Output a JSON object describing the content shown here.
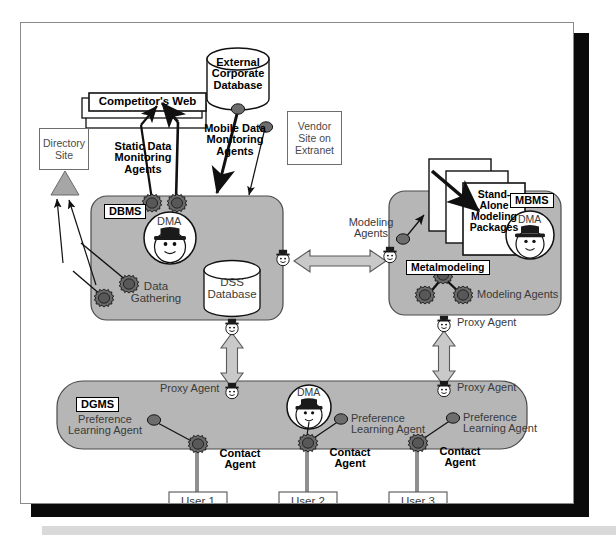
{
  "figure": {
    "kind": "architecture-diagram",
    "colors": {
      "subsystem_fill": "#b6b6b6",
      "subsystem_stroke": "#4a4a4a",
      "agent_fill": "#6f6f6f",
      "agent_stroke": "#1a1a1a",
      "arrow_fill": "#c9c9c9",
      "arrow_stroke": "#5a5a5a",
      "frame_shadow": "#0a0a0a",
      "bottom_bar": "#d9d9d9",
      "page_bg": "#ffffff"
    }
  },
  "external": {
    "corporate_database": "External\nCorporate\nDatabase",
    "competitors_web": "Competitor's Web",
    "directory_site": "Directory\nSite",
    "vendor_site": "Vendor\nSite on\nExtranet",
    "standalone_packages": "Stand-\nAlone\nModeling\nPackages"
  },
  "agent_labels": {
    "static_data_monitoring": "Static Data\nMonitoring\nAgents",
    "mobile_data_monitoring": "Mobile Data\nMonitoring\nAgents",
    "data_gathering": "Data\nGathering",
    "modeling_agents_left": "Modeling\nAgents",
    "modeling_agents_right": "Modeling Agents",
    "metamodeling": "Metalmodeling",
    "proxy_agent": "Proxy Agent",
    "preference_learning": "Preference\nLearning Agent",
    "contact_agent": "Contact\nAgent",
    "dma": "DMA"
  },
  "subsystems": [
    {
      "id": "dbms",
      "label": "DBMS"
    },
    {
      "id": "mbms",
      "label": "MBMS"
    },
    {
      "id": "dgms",
      "label": "DGMS"
    }
  ],
  "stores": {
    "dss_database": "DSS\nDatabase"
  },
  "users": [
    {
      "label": "User 1"
    },
    {
      "label": "User 2"
    },
    {
      "label": "User 3"
    }
  ],
  "proxy_agents": [
    {
      "id": "dbms-right",
      "label": ""
    },
    {
      "id": "mbms-left",
      "label": ""
    },
    {
      "id": "dbms-bottom",
      "label": ""
    },
    {
      "id": "mbms-bottom",
      "label": "Proxy Agent"
    },
    {
      "id": "dgms-left",
      "label": "Proxy Agent"
    },
    {
      "id": "dgms-right",
      "label": "Proxy Agent"
    }
  ],
  "preference_agents": [
    {
      "label": "Preference\nLearning Agent"
    },
    {
      "label": "Preference\nLearning Agent"
    },
    {
      "label": "Preference\nLearning Agent"
    }
  ],
  "contact_agents": [
    {
      "label": "Contact\nAgent"
    },
    {
      "label": "Contact\nAgent"
    },
    {
      "label": "Contact\nAgent"
    }
  ]
}
